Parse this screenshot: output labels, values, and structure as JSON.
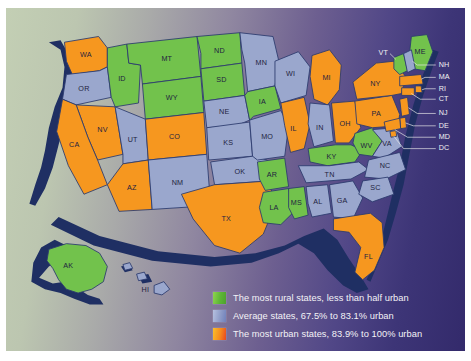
{
  "figure": {
    "kind": "choropleth-map"
  },
  "palette": {
    "rural": "#72c24c",
    "average": "#9aa7cd",
    "urban": "#f6971f",
    "border": "#2c3b6e",
    "coast": "#1f2f63",
    "bg_left": "#c3cfb4",
    "bg_right": "#332a6b",
    "label_dark": "#1f2340",
    "label_light": "#f2f2f2"
  },
  "legend": {
    "items": [
      {
        "swatch": "rural",
        "label": "The most rural states, less than half urban"
      },
      {
        "swatch": "average",
        "label": "Average states, 67.5% to 83.1% urban"
      },
      {
        "swatch": "urban",
        "label": "The most urban states, 83.9% to 100% urban"
      }
    ]
  },
  "map": {
    "states": [
      {
        "abbr": "WA",
        "category": "urban"
      },
      {
        "abbr": "OR",
        "category": "average"
      },
      {
        "abbr": "ID",
        "category": "rural"
      },
      {
        "abbr": "MT",
        "category": "rural"
      },
      {
        "abbr": "WY",
        "category": "rural"
      },
      {
        "abbr": "NV",
        "category": "urban"
      },
      {
        "abbr": "CA",
        "category": "urban"
      },
      {
        "abbr": "UT",
        "category": "average"
      },
      {
        "abbr": "CO",
        "category": "urban"
      },
      {
        "abbr": "AZ",
        "category": "urban"
      },
      {
        "abbr": "NM",
        "category": "average"
      },
      {
        "abbr": "ND",
        "category": "rural"
      },
      {
        "abbr": "SD",
        "category": "rural"
      },
      {
        "abbr": "NE",
        "category": "average"
      },
      {
        "abbr": "KS",
        "category": "average"
      },
      {
        "abbr": "OK",
        "category": "average"
      },
      {
        "abbr": "TX",
        "category": "urban"
      },
      {
        "abbr": "MN",
        "category": "average"
      },
      {
        "abbr": "IA",
        "category": "rural"
      },
      {
        "abbr": "MO",
        "category": "average"
      },
      {
        "abbr": "AR",
        "category": "rural"
      },
      {
        "abbr": "LA",
        "category": "rural"
      },
      {
        "abbr": "WI",
        "category": "average"
      },
      {
        "abbr": "IL",
        "category": "urban"
      },
      {
        "abbr": "MS",
        "category": "rural"
      },
      {
        "abbr": "MI",
        "category": "urban"
      },
      {
        "abbr": "IN",
        "category": "average"
      },
      {
        "abbr": "KY",
        "category": "rural"
      },
      {
        "abbr": "TN",
        "category": "average"
      },
      {
        "abbr": "AL",
        "category": "average"
      },
      {
        "abbr": "GA",
        "category": "average"
      },
      {
        "abbr": "OH",
        "category": "urban"
      },
      {
        "abbr": "WV",
        "category": "rural"
      },
      {
        "abbr": "VA",
        "category": "average"
      },
      {
        "abbr": "NC",
        "category": "average"
      },
      {
        "abbr": "SC",
        "category": "average"
      },
      {
        "abbr": "FL",
        "category": "urban"
      },
      {
        "abbr": "PA",
        "category": "urban"
      },
      {
        "abbr": "NY",
        "category": "urban"
      },
      {
        "abbr": "VT",
        "category": "rural"
      },
      {
        "abbr": "ME",
        "category": "rural"
      },
      {
        "abbr": "NH",
        "category": "average"
      },
      {
        "abbr": "MA",
        "category": "urban"
      },
      {
        "abbr": "RI",
        "category": "urban"
      },
      {
        "abbr": "CT",
        "category": "urban"
      },
      {
        "abbr": "NJ",
        "category": "urban"
      },
      {
        "abbr": "DE",
        "category": "urban"
      },
      {
        "abbr": "MD",
        "category": "urban"
      },
      {
        "abbr": "DC",
        "category": "urban"
      },
      {
        "abbr": "AK",
        "category": "rural"
      },
      {
        "abbr": "HI",
        "category": "average"
      }
    ],
    "callout_labels": [
      "VT",
      "NH",
      "MA",
      "RI",
      "CT",
      "NJ",
      "DE",
      "MD",
      "DC"
    ],
    "inset_labels": [
      "AK",
      "HI"
    ]
  }
}
